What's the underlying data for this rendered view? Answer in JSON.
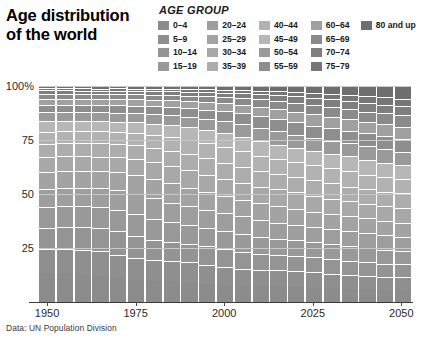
{
  "title": {
    "line1": "Age distribution",
    "line2": "of the world"
  },
  "legend": {
    "heading": "AGE GROUP",
    "columns": [
      [
        {
          "label": "0–4",
          "color": "#8c8c8c"
        },
        {
          "label": "5–9",
          "color": "#8f8f8f"
        },
        {
          "label": "10–14",
          "color": "#949494"
        },
        {
          "label": "15–19",
          "color": "#999999"
        }
      ],
      [
        {
          "label": "20–24",
          "color": "#9e9e9e"
        },
        {
          "label": "25–29",
          "color": "#a3a3a3"
        },
        {
          "label": "30–34",
          "color": "#a8a8a8"
        },
        {
          "label": "35–39",
          "color": "#adadad"
        }
      ],
      [
        {
          "label": "40–44",
          "color": "#b2b2b2"
        },
        {
          "label": "45–49",
          "color": "#b7b7b7"
        },
        {
          "label": "50–54",
          "color": "#9a9a9a"
        },
        {
          "label": "55–59",
          "color": "#8e8e8e"
        }
      ],
      [
        {
          "label": "60–64",
          "color": "#a0a0a0"
        },
        {
          "label": "65–69",
          "color": "#8a8a8a"
        },
        {
          "label": "70–74",
          "color": "#7e7e7e"
        },
        {
          "label": "75–79",
          "color": "#767676"
        }
      ],
      [
        {
          "label": "80 and up",
          "color": "#6e6e6e"
        }
      ]
    ]
  },
  "source": "Data: UN Population Division",
  "chart_data": {
    "type": "bar",
    "title": "Age distribution of the world",
    "subtitle": "",
    "xlabel": "",
    "ylabel": "",
    "ylim": [
      0,
      100
    ],
    "yticks": [
      25,
      50,
      75,
      100
    ],
    "ytick_labels": [
      "25",
      "50",
      "75",
      "100%"
    ],
    "xticks": [
      1950,
      1975,
      2000,
      2025,
      2050
    ],
    "xtick_labels": [
      "1950",
      "1975",
      "2000",
      "2025",
      "2050"
    ],
    "grid": true,
    "legend_position": "top-right",
    "stacked": true,
    "stack_percent": true,
    "categories": [
      "1950",
      "1955",
      "1960",
      "1965",
      "1970",
      "1975",
      "1980",
      "1985",
      "1990",
      "1995",
      "2000",
      "2005",
      "2010",
      "2015",
      "2020",
      "2025",
      "2030",
      "2035",
      "2040",
      "2045",
      "2050"
    ],
    "series": [
      {
        "name": "0–4",
        "color": "#8c8c8c",
        "values": [
          13.3,
          13.6,
          13.7,
          13.2,
          12.5,
          11.7,
          11.5,
          11.6,
          11.2,
          10.4,
          9.7,
          9.3,
          9.1,
          9.0,
          8.7,
          8.1,
          7.6,
          7.2,
          6.9,
          6.6,
          6.4
        ]
      },
      {
        "name": "5–9",
        "color": "#8f8f8f",
        "values": [
          11.1,
          11.8,
          12.2,
          12.5,
          12.1,
          11.5,
          10.9,
          10.8,
          10.9,
          10.6,
          9.9,
          9.3,
          9.0,
          8.9,
          8.8,
          8.5,
          7.9,
          7.5,
          7.1,
          6.8,
          6.6
        ]
      },
      {
        "name": "10–14",
        "color": "#949494",
        "values": [
          10.1,
          10.6,
          11.3,
          11.8,
          12.1,
          11.7,
          11.2,
          10.6,
          10.5,
          10.6,
          10.4,
          9.7,
          9.1,
          8.8,
          8.7,
          8.6,
          8.3,
          7.8,
          7.4,
          7.0,
          6.8
        ]
      },
      {
        "name": "15–19",
        "color": "#999999",
        "values": [
          9.3,
          9.6,
          10.1,
          10.8,
          11.3,
          11.6,
          11.3,
          10.8,
          10.3,
          10.2,
          10.3,
          10.2,
          9.5,
          8.9,
          8.6,
          8.5,
          8.4,
          8.1,
          7.7,
          7.3,
          7.0
        ]
      },
      {
        "name": "20–24",
        "color": "#9e9e9e",
        "values": [
          8.6,
          8.8,
          9.1,
          9.6,
          10.3,
          10.8,
          11.1,
          10.9,
          10.5,
          10.0,
          9.9,
          10.0,
          9.9,
          9.3,
          8.7,
          8.4,
          8.3,
          8.2,
          8.0,
          7.6,
          7.2
        ]
      },
      {
        "name": "25–29",
        "color": "#a3a3a3",
        "values": [
          7.8,
          8.0,
          8.2,
          8.5,
          9.0,
          9.7,
          10.2,
          10.5,
          10.4,
          10.0,
          9.6,
          9.5,
          9.7,
          9.6,
          9.1,
          8.5,
          8.2,
          8.1,
          8.0,
          7.8,
          7.5
        ]
      },
      {
        "name": "30–34",
        "color": "#a8a8a8",
        "values": [
          6.9,
          7.1,
          7.4,
          7.6,
          7.9,
          8.4,
          9.1,
          9.6,
          9.9,
          9.9,
          9.6,
          9.2,
          9.1,
          9.3,
          9.3,
          8.9,
          8.3,
          8.0,
          7.9,
          7.8,
          7.6
        ]
      },
      {
        "name": "35–39",
        "color": "#adadad",
        "values": [
          6.3,
          6.3,
          6.5,
          6.8,
          7.0,
          7.4,
          7.9,
          8.5,
          9.0,
          9.4,
          9.5,
          9.2,
          8.8,
          8.7,
          8.9,
          9.0,
          8.6,
          8.1,
          7.8,
          7.7,
          7.6
        ]
      },
      {
        "name": "40–44",
        "color": "#b2b2b2",
        "values": [
          5.5,
          5.7,
          5.8,
          6.0,
          6.2,
          6.5,
          6.9,
          7.4,
          7.9,
          8.5,
          8.9,
          9.0,
          8.8,
          8.4,
          8.3,
          8.5,
          8.6,
          8.3,
          7.8,
          7.6,
          7.4
        ]
      },
      {
        "name": "45–49",
        "color": "#b7b7b7",
        "values": [
          4.8,
          4.9,
          5.1,
          5.2,
          5.4,
          5.7,
          6.0,
          6.4,
          6.8,
          7.3,
          7.9,
          8.3,
          8.4,
          8.2,
          7.9,
          7.8,
          8.0,
          8.1,
          7.9,
          7.5,
          7.3
        ]
      },
      {
        "name": "50–54",
        "color": "#9a9a9a",
        "values": [
          4.1,
          4.2,
          4.3,
          4.5,
          4.6,
          4.9,
          5.2,
          5.5,
          5.8,
          6.2,
          6.7,
          7.2,
          7.6,
          7.7,
          7.5,
          7.3,
          7.2,
          7.4,
          7.5,
          7.3,
          7.0
        ]
      },
      {
        "name": "55–59",
        "color": "#8e8e8e",
        "values": [
          3.4,
          3.5,
          3.6,
          3.7,
          3.9,
          4.0,
          4.3,
          4.6,
          4.9,
          5.2,
          5.6,
          6.1,
          6.5,
          6.9,
          7.0,
          6.9,
          6.7,
          6.7,
          6.9,
          7.0,
          6.8
        ]
      },
      {
        "name": "60–64",
        "color": "#a0a0a0",
        "values": [
          2.9,
          2.9,
          3.0,
          3.1,
          3.2,
          3.3,
          3.4,
          3.7,
          4.0,
          4.2,
          4.5,
          4.9,
          5.4,
          5.8,
          6.1,
          6.3,
          6.2,
          6.1,
          6.2,
          6.4,
          6.4
        ]
      },
      {
        "name": "65–69",
        "color": "#8a8a8a",
        "values": [
          2.3,
          2.3,
          2.4,
          2.4,
          2.5,
          2.6,
          2.7,
          2.8,
          3.0,
          3.3,
          3.5,
          3.8,
          4.1,
          4.6,
          5.0,
          5.3,
          5.5,
          5.5,
          5.4,
          5.6,
          5.8
        ]
      },
      {
        "name": "70–74",
        "color": "#7e7e7e",
        "values": [
          1.6,
          1.7,
          1.7,
          1.8,
          1.8,
          1.9,
          2.0,
          2.1,
          2.2,
          2.3,
          2.5,
          2.7,
          3.0,
          3.3,
          3.7,
          4.1,
          4.4,
          4.6,
          4.7,
          4.7,
          4.9
        ]
      },
      {
        "name": "75–79",
        "color": "#767676",
        "values": [
          1.0,
          1.0,
          1.1,
          1.1,
          1.2,
          1.2,
          1.3,
          1.4,
          1.5,
          1.6,
          1.7,
          1.8,
          2.0,
          2.2,
          2.5,
          2.8,
          3.2,
          3.4,
          3.6,
          3.8,
          3.9
        ]
      },
      {
        "name": "80 and up",
        "color": "#6e6e6e",
        "values": [
          1.0,
          1.0,
          1.1,
          1.2,
          1.2,
          1.3,
          1.4,
          1.5,
          1.6,
          1.8,
          2.0,
          2.2,
          2.5,
          2.8,
          3.2,
          3.6,
          4.1,
          4.7,
          5.4,
          6.0,
          6.5
        ]
      }
    ]
  }
}
